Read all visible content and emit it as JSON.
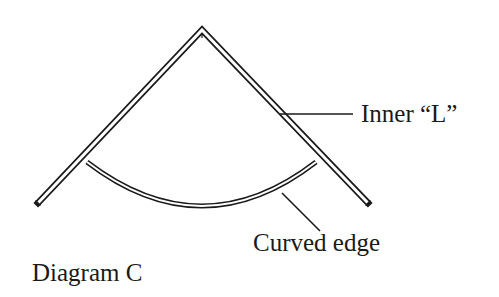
{
  "diagram": {
    "caption": "Diagram C",
    "labels": {
      "inner_l": "Inner “L”",
      "curved_edge": "Curved edge"
    },
    "colors": {
      "stroke": "#1a1a1a",
      "background": "#ffffff"
    },
    "shapes": {
      "inner_l": {
        "apex": [
          202,
          30
        ],
        "left_end": [
          40,
          205
        ],
        "right_end": [
          366,
          204
        ],
        "style": "double-line"
      },
      "curved_edge": {
        "start": [
          86,
          161
        ],
        "end": [
          317,
          161
        ],
        "lowest_point": [
          202,
          207
        ],
        "style": "double-line"
      },
      "leaders": [
        {
          "target": "inner_l",
          "from": [
            280,
            114
          ],
          "to": [
            353,
            114
          ]
        },
        {
          "target": "curved_edge",
          "from": [
            282,
            192
          ],
          "to": [
            320,
            231
          ]
        }
      ]
    }
  }
}
